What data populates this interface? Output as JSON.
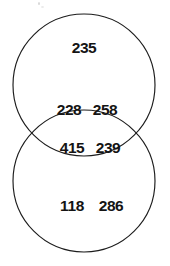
{
  "figure": {
    "type": "venn-diagram",
    "set_count": 2,
    "background_color": "#ffffff",
    "stroke_color": "#1c1c1c",
    "text_color": "#141414"
  },
  "chart_data": {
    "type": "table",
    "title": "",
    "xlabel": "",
    "ylabel": "",
    "diagram": "two-circle vertical venn diagram",
    "regions": [
      {
        "id": "top-only",
        "position": "upper circle only",
        "values": [
          "235"
        ]
      },
      {
        "id": "intersection",
        "position": "overlap lens",
        "values": [
          "228",
          "258",
          "415",
          "239"
        ]
      },
      {
        "id": "bottom-only",
        "position": "lower circle only",
        "values": [
          "118",
          "286"
        ]
      }
    ],
    "values": [
      235,
      228,
      258,
      415,
      239,
      118,
      286
    ],
    "categories": [
      "top-only",
      "int-1",
      "int-2",
      "int-3",
      "int-4",
      "bottom-1",
      "bottom-2"
    ],
    "legend": [],
    "annotations": []
  },
  "labels": {
    "top_a": "235",
    "int_a": "228",
    "int_b": "258",
    "int_c": "415",
    "int_d": "239",
    "bot_a": "118",
    "bot_b": "286"
  },
  "circles": {
    "top": {
      "cx": 84,
      "cy": 85,
      "r": 71
    },
    "bottom": {
      "cx": 84,
      "cy": 181,
      "r": 71
    }
  }
}
